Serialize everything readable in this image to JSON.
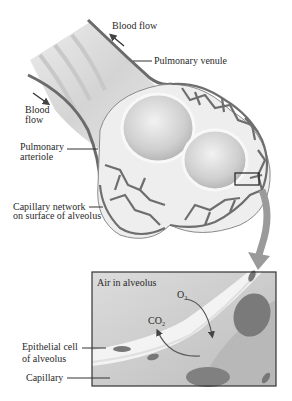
{
  "diagram": {
    "labels": {
      "blood_flow_top": "Blood flow",
      "pulmonary_venule": "Pulmonary venule",
      "blood_flow_left_1": "Blood",
      "blood_flow_left_2": "flow",
      "pulmonary_arteriole_1": "Pulmonary",
      "pulmonary_arteriole_2": "arteriole",
      "capillary_network_1": "Capillary network",
      "capillary_network_2": "on surface of alveolus"
    },
    "inset": {
      "title": "Air in alveolus",
      "o2": "O",
      "o2_sub": "2",
      "co2": "CO",
      "co2_sub": "2",
      "epithelial_1": "Epithelial cell",
      "epithelial_2": "of alveolus",
      "capillary": "Capillary"
    },
    "colors": {
      "vessel": "#6b6b6b",
      "alveolus_fill": "#d9d9d9",
      "inset_bg": "#cfcfcf",
      "rbc": "#7a7a7a",
      "border": "#333333"
    }
  }
}
